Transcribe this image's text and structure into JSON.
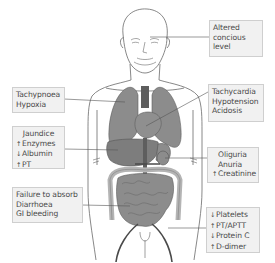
{
  "figure": {
    "colors": {
      "organ_fill": "#8c8c8c",
      "organ_dark": "#5e5e5e",
      "outline": "#555555",
      "box_fill": "#f1f1f1",
      "box_border": "#cfcfcf",
      "text": "#4a4a4a"
    }
  },
  "labels": {
    "brain": {
      "organ": "brain",
      "lines": [
        "Altered",
        "concious",
        "level"
      ]
    },
    "lungs": {
      "organ": "lungs",
      "lines": [
        "Tachypnoea",
        "Hypoxia"
      ]
    },
    "heart": {
      "organ": "heart",
      "lines": [
        "Tachycardia",
        "Hypotension",
        "Acidosis"
      ]
    },
    "liver": {
      "organ": "liver",
      "lines": [
        {
          "arrow": "",
          "text": "Jaundice"
        },
        {
          "arrow": "up-arrow",
          "symbol": "↑",
          "text": "Enzymes"
        },
        {
          "arrow": "down-arrow",
          "symbol": "↓",
          "text": "Albumin"
        },
        {
          "arrow": "up-arrow",
          "symbol": "↑",
          "text": "PT"
        }
      ]
    },
    "kidney": {
      "organ": "kidney",
      "lines": [
        {
          "arrow": "",
          "text": "Oliguria"
        },
        {
          "arrow": "",
          "text": "Anuria"
        },
        {
          "arrow": "up-arrow",
          "symbol": "↑",
          "text": "Creatinine"
        }
      ]
    },
    "gut": {
      "organ": "intestines",
      "lines": [
        "Failure to absorb",
        "Diarrhoea",
        "GI bleeding"
      ]
    },
    "blood": {
      "organ": "blood vessels",
      "lines": [
        {
          "arrow": "down-arrow",
          "symbol": "↓",
          "text": "Platelets"
        },
        {
          "arrow": "up-arrow",
          "symbol": "↑",
          "text": "PT/APTT"
        },
        {
          "arrow": "down-arrow",
          "symbol": "↓",
          "text": "Protein C"
        },
        {
          "arrow": "up-arrow",
          "symbol": "↑",
          "text": "D-dimer"
        }
      ]
    }
  }
}
